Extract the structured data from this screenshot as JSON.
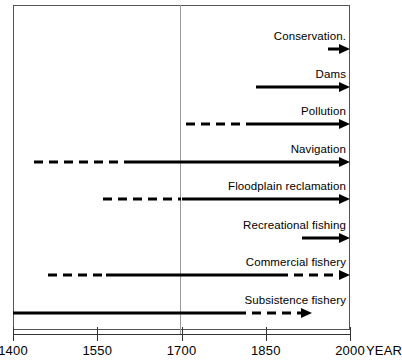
{
  "chart_data": {
    "type": "bar",
    "title": "",
    "xlabel": "YEAR",
    "ylabel": "",
    "xlim": [
      1400,
      2000
    ],
    "grid": true,
    "gridlines": [
      1700
    ],
    "legend": "none",
    "axis_ticks": [
      {
        "value": 1400,
        "label": "1400"
      },
      {
        "value": 1550,
        "label": "1550"
      },
      {
        "value": 1700,
        "label": "1700"
      },
      {
        "value": 1850,
        "label": "1850"
      },
      {
        "value": 2000,
        "label": "2000"
      }
    ],
    "axis_unit_label": "YEAR",
    "categories": [
      "Conservation.",
      "Dams",
      "Pollution",
      "Navigation",
      "Floodplain reclamation",
      "Recreational fishing",
      "Commercial fishery",
      "Subsistence fishery"
    ],
    "series": [
      {
        "name": "Conservation.",
        "label": "Conservation.",
        "start": 1960,
        "end": 2000,
        "arrow": true,
        "segments": [
          {
            "from": 1960,
            "to": 2000,
            "style": "solid"
          }
        ]
      },
      {
        "name": "Dams",
        "label": "Dams",
        "start": 1833,
        "end": 2000,
        "arrow": true,
        "segments": [
          {
            "from": 1833,
            "to": 2000,
            "style": "solid"
          }
        ]
      },
      {
        "name": "Pollution",
        "label": "Pollution",
        "start": 1708,
        "end": 2000,
        "arrow": true,
        "segments": [
          {
            "from": 1708,
            "to": 1817,
            "style": "dashed"
          },
          {
            "from": 1817,
            "to": 2000,
            "style": "solid"
          }
        ]
      },
      {
        "name": "Navigation",
        "label": "Navigation",
        "start": 1437,
        "end": 2000,
        "arrow": true,
        "segments": [
          {
            "from": 1437,
            "to": 1603,
            "style": "dashed"
          },
          {
            "from": 1603,
            "to": 2000,
            "style": "solid"
          }
        ]
      },
      {
        "name": "Floodplain reclamation",
        "label": "Floodplain reclamation",
        "start": 1560,
        "end": 2000,
        "arrow": true,
        "segments": [
          {
            "from": 1560,
            "to": 1700,
            "style": "dashed"
          },
          {
            "from": 1700,
            "to": 2000,
            "style": "solid"
          }
        ]
      },
      {
        "name": "Recreational fishing",
        "label": "Recreational fishing",
        "start": 1915,
        "end": 2000,
        "arrow": true,
        "segments": [
          {
            "from": 1915,
            "to": 2000,
            "style": "solid"
          }
        ]
      },
      {
        "name": "Commercial fishery",
        "label": "Commercial fishery",
        "start": 1463,
        "end": 2000,
        "arrow": true,
        "segments": [
          {
            "from": 1463,
            "to": 1566,
            "style": "dashed"
          },
          {
            "from": 1566,
            "to": 1873,
            "style": "solid"
          },
          {
            "from": 1873,
            "to": 2000,
            "style": "dashed"
          }
        ]
      },
      {
        "name": "Subsistence fishery",
        "label": "Subsistence fishery",
        "start": 1400,
        "end": 1932,
        "arrow": true,
        "segments": [
          {
            "from": 1400,
            "to": 1799,
            "style": "solid"
          },
          {
            "from": 1799,
            "to": 1932,
            "style": "dashed"
          }
        ]
      }
    ]
  }
}
